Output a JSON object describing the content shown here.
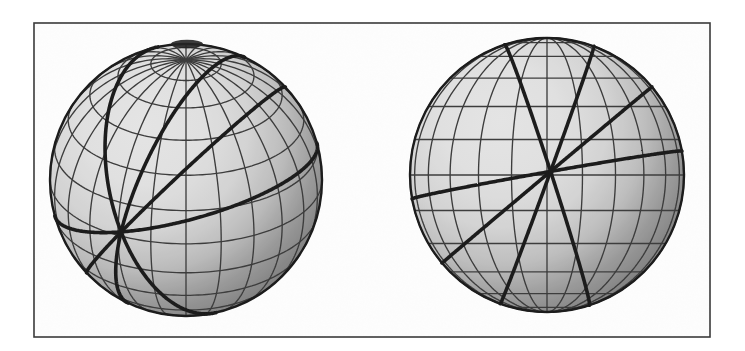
{
  "figure": {
    "caption": "",
    "canvas": {
      "width": 745,
      "height": 351,
      "background": "#ffffff"
    },
    "frame": {
      "label": "figure-border",
      "x": 34,
      "y": 23,
      "width": 676,
      "height": 314,
      "stroke": "#3a3a3a",
      "stroke_width": 1.6,
      "fill": "#fdfdfd"
    },
    "ink_color": "#2b2b2b",
    "grid_color": "#3c3c3c",
    "bold_color": "#1c1c1c",
    "shading": {
      "highlight": "#ffffff",
      "midtone": "#d8d8d8",
      "shadow": "#8d8d8d",
      "terminator": "#6e6e6e"
    }
  },
  "panels": [
    {
      "id": "left-sphere",
      "name": "sphere-tilted-pole-visible",
      "center_x": 186,
      "center_y": 180,
      "radius": 136,
      "view": {
        "tilt_deg": 62,
        "yaw_deg": 0,
        "pole_visible": true,
        "pole_screen_x": 187,
        "pole_screen_y": 44
      },
      "graticule": {
        "meridian_count": 24,
        "meridian_step_deg": 15,
        "parallel_count": 11,
        "parallel_step_deg": 15,
        "stroke_width": 1.35
      },
      "bold_arcs": {
        "count": 4,
        "description": "four bold great circles crossing at a common node on the lower-left of the disk",
        "node_screen_x": 121,
        "node_screen_y": 232,
        "stroke_width": 3.6,
        "inclinations_deg": [
          18,
          52,
          78,
          115
        ]
      },
      "light": {
        "source": "upper-left",
        "cx_frac": 0.34,
        "cy_frac": 0.3
      }
    },
    {
      "id": "right-sphere",
      "name": "sphere-equator-edge-on",
      "center_x": 547,
      "center_y": 175,
      "radius": 137,
      "view": {
        "tilt_deg": 90,
        "yaw_deg": 0,
        "pole_visible": false,
        "pole_screen_x": 547,
        "pole_screen_y": 38
      },
      "graticule": {
        "meridian_count": 24,
        "meridian_step_deg": 15,
        "parallel_count": 11,
        "parallel_step_deg": 15,
        "stroke_width": 1.35
      },
      "bold_arcs": {
        "count": 4,
        "description": "four bold great circles crossing at a common node just above the sphere centre",
        "node_screen_x": 551,
        "node_screen_y": 172,
        "stroke_width": 3.6,
        "inclinations_deg": [
          10,
          40,
          70,
          108
        ]
      },
      "light": {
        "source": "upper-left",
        "cx_frac": 0.33,
        "cy_frac": 0.3
      }
    }
  ]
}
